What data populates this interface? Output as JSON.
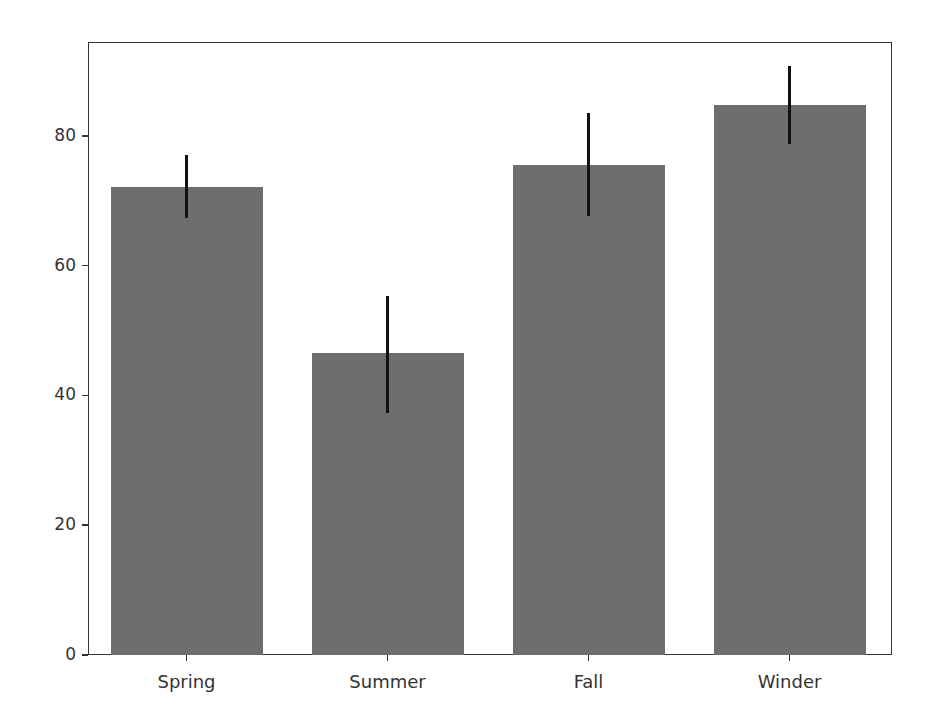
{
  "chart_data": {
    "type": "bar",
    "title": "",
    "xlabel": "",
    "ylabel": "",
    "categories": [
      "Spring",
      "Summer",
      "Fall",
      "Winder"
    ],
    "values": [
      72.1,
      46.5,
      75.5,
      84.7
    ],
    "error_bars": {
      "lower": [
        67.3,
        37.3,
        67.6,
        78.7
      ],
      "upper": [
        77.0,
        55.3,
        83.5,
        90.8
      ]
    },
    "ylim": [
      0,
      94
    ],
    "yticks": [
      0,
      20,
      40,
      60,
      80
    ],
    "ytick_labels": [
      "0",
      "20",
      "40",
      "60",
      "80"
    ],
    "grid": false,
    "legend": null,
    "bar_color": "#6e6e6e",
    "errorbar_color": "#111111"
  }
}
